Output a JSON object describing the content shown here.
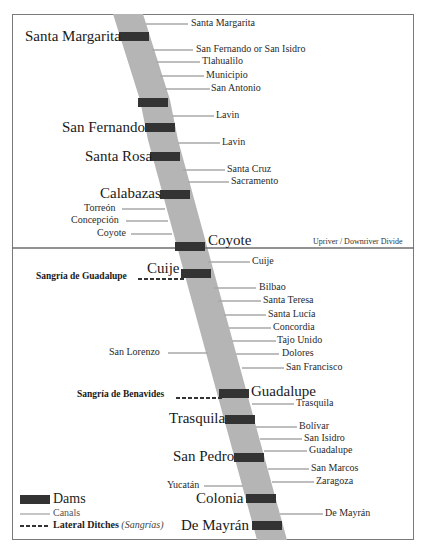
{
  "colors": {
    "river": "#b5b5b5",
    "dam": "#333333",
    "canal": "#a8a8a8",
    "frame": "#7a7a7a",
    "divide_line": "#6e6e6e",
    "text": "#1e1e1e"
  },
  "divide": {
    "label": "Upriver / Downriver Divide"
  },
  "dams": [
    {
      "label": "Santa Margarita"
    },
    {
      "label": ""
    },
    {
      "label": "San Fernando"
    },
    {
      "label": "Santa Rosa"
    },
    {
      "label": "Calabazas"
    },
    {
      "label": "Coyote"
    },
    {
      "label": "Cuije"
    },
    {
      "label": "Guadalupe"
    },
    {
      "label": "Trasquila"
    },
    {
      "label": "San Pedro"
    },
    {
      "label": "Colonia"
    },
    {
      "label": "De Mayrán"
    }
  ],
  "canals_right": [
    {
      "label": "Santa Margarita"
    },
    {
      "label": "San Fernando or San Isidro"
    },
    {
      "label": "Tlahualilo"
    },
    {
      "label": "Municipio"
    },
    {
      "label": "San Antonio"
    },
    {
      "label": "Lavin"
    },
    {
      "label": "Lavin"
    },
    {
      "label": "Santa Cruz"
    },
    {
      "label": "Sacramento"
    },
    {
      "label": "Cuije"
    },
    {
      "label": "Bilbao"
    },
    {
      "label": "Santa Teresa"
    },
    {
      "label": "Santa Lucía"
    },
    {
      "label": "Concordia"
    },
    {
      "label": "Tajo Unido"
    },
    {
      "label": "Dolores"
    },
    {
      "label": "San Francisco"
    },
    {
      "label": "Trasquila"
    },
    {
      "label": "Bolívar"
    },
    {
      "label": "San Isidro"
    },
    {
      "label": "Guadalupe"
    },
    {
      "label": "San Marcos"
    },
    {
      "label": "Zaragoza"
    },
    {
      "label": "De Mayrán"
    }
  ],
  "canals_left": [
    {
      "label": "Torreón"
    },
    {
      "label": "Concepción"
    },
    {
      "label": "Coyote"
    },
    {
      "label": "San Lorenzo"
    },
    {
      "label": "Yucatán"
    }
  ],
  "sangrias": [
    {
      "label": "Sangría de Guadalupe"
    },
    {
      "label": "Sangría de Benavides"
    }
  ],
  "legend": {
    "dams": "Dams",
    "canals": "Canals",
    "lateral_ditches": "Lateral Ditches",
    "lateral_ditches_note": "(Sangrías)"
  }
}
